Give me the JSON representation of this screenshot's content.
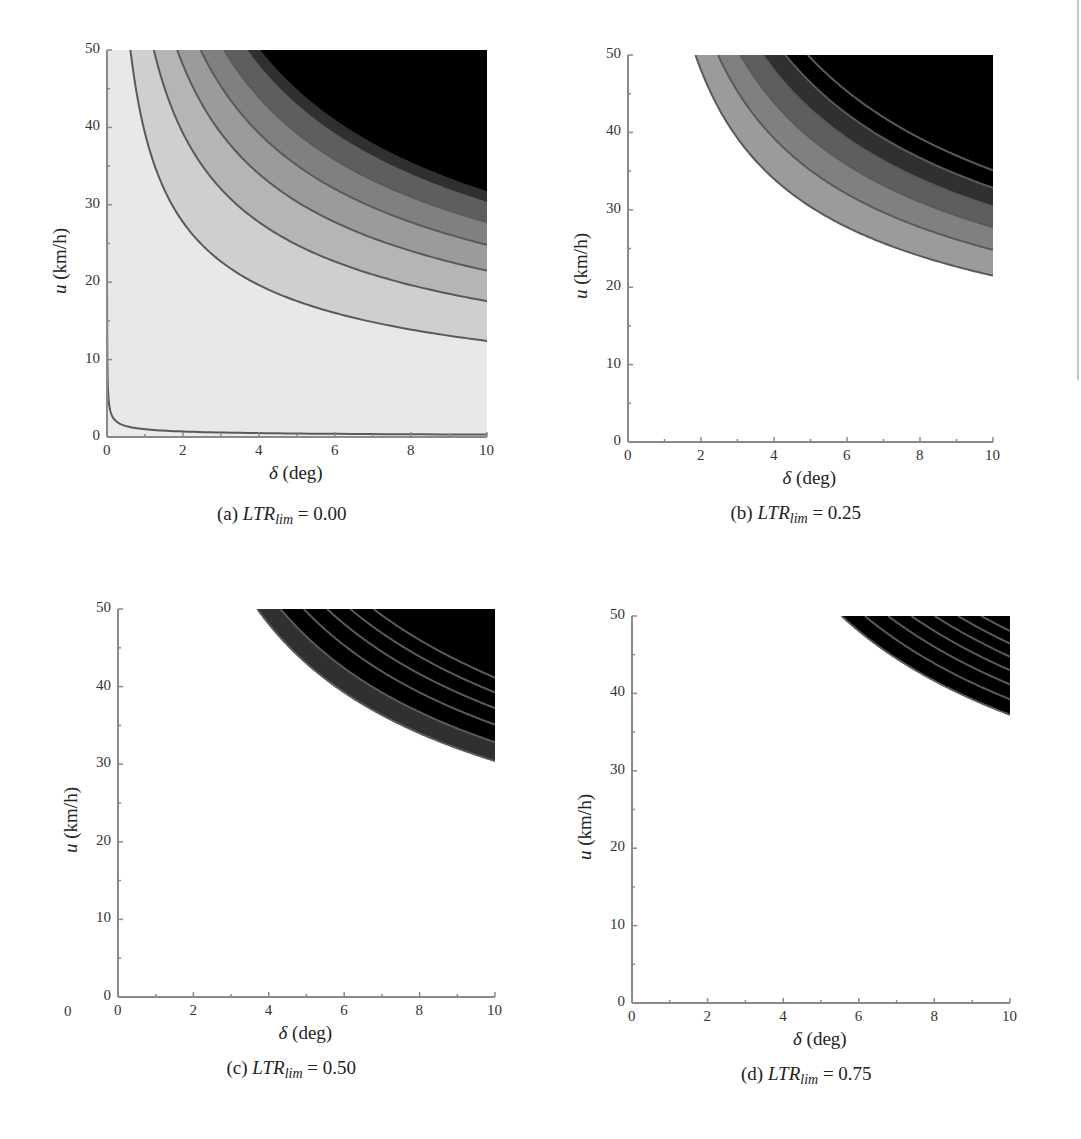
{
  "figure": {
    "stray_label": "0",
    "colors": {
      "axis": "#8a8a8a",
      "contour_line": "#5a5a5a",
      "background": "#ffffff",
      "panel_a_base": "#ebebeb",
      "band_shades": [
        "#e8e8e8",
        "#cfcfcf",
        "#b5b5b5",
        "#9b9b9b",
        "#808080",
        "#5e5e5e",
        "#303030",
        "#000000"
      ]
    }
  },
  "chart_data": [
    {
      "type": "heatmap",
      "subtype": "filled-contour",
      "caption_prefix": "(a)",
      "caption_var": "LTR",
      "caption_sub": "lim",
      "caption_value": "= 0.00",
      "xlabel_sym": "δ",
      "xlabel_unit": "(deg)",
      "ylabel_sym": "u",
      "ylabel_unit": "(km/h)",
      "xlim": [
        0,
        10
      ],
      "ylim": [
        0,
        50
      ],
      "xticks": [
        "0",
        "2",
        "4",
        "6",
        "8",
        "10"
      ],
      "yticks": [
        "0",
        "10",
        "20",
        "30",
        "40",
        "50"
      ],
      "contour_model": "u = sqrt(K / delta)",
      "contour_levels_K": [
        1,
        1541,
        3081,
        4621,
        6161,
        7701,
        9241
      ],
      "contours_at_top_edge_delta": [
        0.0,
        0.58,
        1.22,
        1.9,
        2.49,
        3.17,
        3.9
      ],
      "contours_at_right_edge_u": [
        0.3,
        12.3,
        17.4,
        21.3,
        24.7,
        27.8,
        30.5
      ],
      "black_region_from": "u≈30.5 at δ=10; δ≈3.9 at u=50",
      "base_fill": "light-gray",
      "box": {
        "x0": 107,
        "x1": 487,
        "y0": 50,
        "y1": 437
      }
    },
    {
      "type": "heatmap",
      "subtype": "filled-contour",
      "caption_prefix": "(b)",
      "caption_var": "LTR",
      "caption_sub": "lim",
      "caption_value": "= 0.25",
      "xlabel_sym": "δ",
      "xlabel_unit": "(deg)",
      "ylabel_sym": "u",
      "ylabel_unit": "(km/h)",
      "xlim": [
        0,
        10
      ],
      "ylim": [
        0,
        50
      ],
      "xticks": [
        "0",
        "2",
        "4",
        "6",
        "8",
        "10"
      ],
      "yticks": [
        "0",
        "10",
        "20",
        "30",
        "40",
        "50"
      ],
      "contour_model": "u = sqrt(K / delta)",
      "contour_levels_K": [
        4621,
        6161,
        7701,
        9241,
        10781,
        12321,
        13861
      ],
      "contours_at_top_edge_delta": [
        1.84,
        2.52,
        3.16,
        3.8,
        4.44,
        5.12,
        5.8
      ],
      "contours_at_right_edge_u": [
        21.3,
        24.8,
        27.8,
        30.5,
        33.2,
        35.4,
        37.7
      ],
      "base_fill": "white",
      "box": {
        "x0": 628,
        "x1": 993,
        "y0": 55,
        "y1": 442
      }
    },
    {
      "type": "heatmap",
      "subtype": "filled-contour",
      "caption_prefix": "(c)",
      "caption_var": "LTR",
      "caption_sub": "lim",
      "caption_value": "= 0.50",
      "xlabel_sym": "δ",
      "xlabel_unit": "(deg)",
      "ylabel_sym": "u",
      "ylabel_unit": "(km/h)",
      "xlim": [
        0,
        10
      ],
      "ylim": [
        0,
        50
      ],
      "xticks": [
        "0",
        "2",
        "4",
        "6",
        "8",
        "10"
      ],
      "yticks": [
        "0",
        "10",
        "20",
        "30",
        "40",
        "50"
      ],
      "contour_model": "u = sqrt(K / delta)",
      "contour_levels_K": [
        9241,
        10781,
        12321,
        13861,
        15401,
        16941,
        18481
      ],
      "contours_at_top_edge_delta": [
        3.71,
        4.38,
        5.0,
        5.67,
        6.3,
        6.95,
        7.6
      ],
      "contours_at_right_edge_u": [
        30.2,
        32.7,
        35.0,
        37.4,
        39.6,
        41.7,
        43.8
      ],
      "base_fill": "white",
      "box": {
        "x0": 118,
        "x1": 495,
        "y0": 609,
        "y1": 997
      }
    },
    {
      "type": "heatmap",
      "subtype": "filled-contour",
      "caption_prefix": "(d)",
      "caption_var": "LTR",
      "caption_sub": "lim",
      "caption_value": "= 0.75",
      "xlabel_sym": "δ",
      "xlabel_unit": "(deg)",
      "ylabel_sym": "u",
      "ylabel_unit": "(km/h)",
      "xlim": [
        0,
        10
      ],
      "ylim": [
        0,
        50
      ],
      "xticks": [
        "0",
        "2",
        "4",
        "6",
        "8",
        "10"
      ],
      "yticks": [
        "0",
        "10",
        "20",
        "30",
        "40",
        "50"
      ],
      "contour_model": "u = sqrt(K / delta)",
      "contour_levels_K": [
        13861,
        15401,
        16941,
        18481,
        20021,
        21561,
        23101
      ],
      "contours_at_top_edge_delta": [
        5.63,
        6.3,
        6.96,
        7.6,
        8.2,
        8.85
      ],
      "contours_at_right_edge_u": [
        37.2,
        39.5,
        41.5,
        43.4,
        45.4,
        47.2
      ],
      "base_fill": "white",
      "box": {
        "x0": 632,
        "x1": 1010,
        "y0": 616,
        "y1": 1003
      }
    }
  ]
}
